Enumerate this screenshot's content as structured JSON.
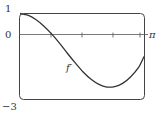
{
  "chart_data": {
    "type": "line",
    "title": "",
    "xlabel": "",
    "ylabel": "",
    "xlim": [
      0,
      3.1416
    ],
    "ylim": [
      -3,
      1
    ],
    "grid": false,
    "legend": "none",
    "x_tick_labels": [
      "0",
      "π"
    ],
    "y_tick_labels": [
      "1",
      "0",
      "-3"
    ],
    "x_ticks_minor": [
      0.785,
      1.571,
      2.356,
      3.1416
    ],
    "series": [
      {
        "name": "f'",
        "x": [
          0,
          0.2,
          0.4,
          0.6,
          0.8,
          1.0,
          1.2,
          1.4,
          1.6,
          1.8,
          2.0,
          2.2,
          2.4,
          2.6,
          2.8,
          3.0,
          3.1416
        ],
        "values": [
          1.0,
          0.92,
          0.72,
          0.42,
          0.05,
          -0.38,
          -0.85,
          -1.3,
          -1.72,
          -2.06,
          -2.3,
          -2.42,
          -2.4,
          -2.25,
          -1.95,
          -1.52,
          -1.0
        ]
      }
    ],
    "annotations": [
      {
        "text": "f'",
        "x": 1.5,
        "y": -1.55
      }
    ]
  },
  "labels": {
    "y_top": "1",
    "y_zero": "0",
    "y_bottom": "−3",
    "x_end": "π",
    "curve": "f′"
  }
}
